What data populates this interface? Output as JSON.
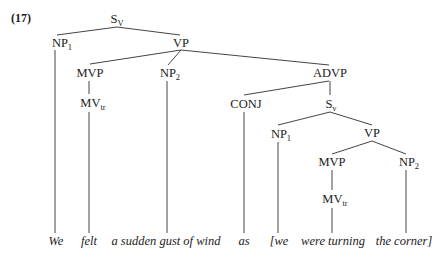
{
  "example_number": "(17)",
  "nodes": {
    "root": {
      "label": "S",
      "sub": "V"
    },
    "np1": {
      "label": "NP",
      "sub": "1"
    },
    "vp": {
      "label": "VP",
      "sub": ""
    },
    "mvp": {
      "label": "MVP",
      "sub": ""
    },
    "np2": {
      "label": "NP",
      "sub": "2"
    },
    "advp": {
      "label": "ADVP",
      "sub": ""
    },
    "mv_tr": {
      "label": "MV",
      "sub": "tr"
    },
    "conj": {
      "label": "CONJ",
      "sub": ""
    },
    "s_inner": {
      "label": "S",
      "sub": "v"
    },
    "np1_inner": {
      "label": "NP",
      "sub": "1"
    },
    "vp_inner": {
      "label": "VP",
      "sub": ""
    },
    "mvp_inner": {
      "label": "MVP",
      "sub": ""
    },
    "np2_inner": {
      "label": "NP",
      "sub": "2"
    },
    "mv_tr_inner": {
      "label": "MV",
      "sub": "tr"
    }
  },
  "words": [
    "We",
    "felt",
    "a sudden gust of wind",
    "as",
    "[we",
    "were turning",
    "the corner]"
  ],
  "edges": [
    [
      "S_V",
      "NP1"
    ],
    [
      "S_V",
      "VP"
    ],
    [
      "VP",
      "MVP"
    ],
    [
      "VP",
      "NP2"
    ],
    [
      "VP",
      "ADVP"
    ],
    [
      "MVP",
      "MV_tr"
    ],
    [
      "ADVP",
      "CONJ"
    ],
    [
      "ADVP",
      "S_v"
    ],
    [
      "S_v",
      "NP1"
    ],
    [
      "S_v",
      "VP"
    ],
    [
      "VP",
      "MVP"
    ],
    [
      "VP",
      "NP2"
    ],
    [
      "MVP",
      "MV_tr"
    ]
  ]
}
